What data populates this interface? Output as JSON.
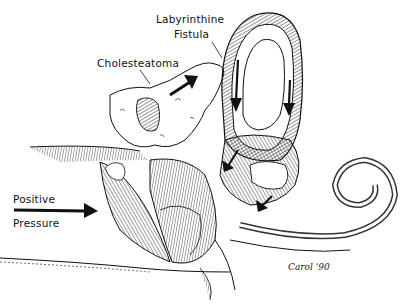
{
  "figure": {
    "style": "black ink line illustration with hatching",
    "colors": {
      "ink": "#111111",
      "background": "#ffffff"
    }
  },
  "labels": {
    "labyrinthine_line1": "Labyrinthine",
    "labyrinthine_line2": "Fistula",
    "cholesteatoma": "Cholesteatoma",
    "positive": "Positive",
    "pressure": "Pressure"
  },
  "signature": {
    "name": "Carol",
    "year": "'90"
  },
  "arrows": [
    {
      "name": "positive-pressure-arrow",
      "direction": "right"
    },
    {
      "name": "cholesteatoma-growth-arrow",
      "direction": "up-right"
    },
    {
      "name": "canal-flow-arrow-left",
      "direction": "down"
    },
    {
      "name": "canal-flow-arrow-right",
      "direction": "down"
    },
    {
      "name": "vestibule-arrow",
      "direction": "down-left"
    },
    {
      "name": "cochlea-arrow",
      "direction": "down-left"
    }
  ]
}
